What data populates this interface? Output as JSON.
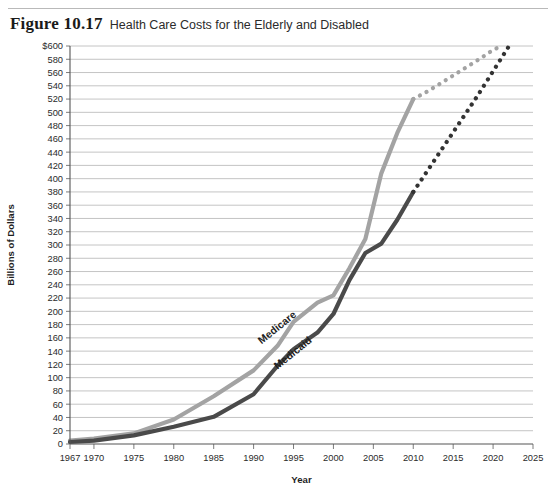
{
  "figure": {
    "number": "Figure 10.17",
    "title": "Health Care Costs for the Elderly and Disabled"
  },
  "chart_data": {
    "type": "line",
    "title": "Health Care Costs for the Elderly and Disabled",
    "xlabel": "Year",
    "ylabel": "Billions of Dollars",
    "xlim": [
      1967,
      2025
    ],
    "ylim": [
      0,
      600
    ],
    "grid": true,
    "legend": "inline-labels",
    "y_ticks": [
      0,
      20,
      40,
      60,
      80,
      100,
      120,
      140,
      160,
      180,
      200,
      220,
      240,
      260,
      280,
      300,
      320,
      340,
      360,
      380,
      400,
      420,
      440,
      460,
      480,
      500,
      520,
      540,
      560,
      580,
      600
    ],
    "y_tick_labels": [
      "0",
      "20",
      "40",
      "60",
      "80",
      "100",
      "120",
      "140",
      "160",
      "180",
      "200",
      "220",
      "240",
      "260",
      "280",
      "300",
      "320",
      "340",
      "360",
      "380",
      "400",
      "420",
      "440",
      "460",
      "480",
      "500",
      "520",
      "540",
      "560",
      "580",
      "$600"
    ],
    "x_ticks": [
      1967,
      1970,
      1975,
      1980,
      1985,
      1990,
      1995,
      2000,
      2005,
      2010,
      2015,
      2020,
      2025
    ],
    "x_tick_labels": [
      "1967",
      "1970",
      "1975",
      "1980",
      "1985",
      "1990",
      "1995",
      "2000",
      "2005",
      "2010",
      "2015",
      "2020",
      "2025"
    ],
    "series": [
      {
        "name": "Medicare",
        "color": "#a3a3a3",
        "projection_color": "#a3a3a3",
        "label_x": 1991,
        "label_y": 150,
        "label_rotation": -39,
        "actual": {
          "x": [
            1967,
            1970,
            1975,
            1980,
            1985,
            1990,
            1993,
            1995,
            1998,
            2000,
            2002,
            2004,
            2006,
            2008,
            2010
          ],
          "y": [
            5,
            8,
            16,
            37,
            72,
            111,
            148,
            184,
            213,
            224,
            265,
            309,
            408,
            469,
            520
          ]
        },
        "projected": {
          "x": [
            2010,
            2012,
            2014,
            2016,
            2018,
            2020,
            2021
          ],
          "y": [
            520,
            533,
            548,
            563,
            578,
            594,
            600
          ]
        }
      },
      {
        "name": "Medicaid",
        "color": "#4a4a4a",
        "projection_color": "#333333",
        "label_x": 1993,
        "label_y": 112,
        "label_rotation": -39,
        "actual": {
          "x": [
            1967,
            1970,
            1975,
            1980,
            1985,
            1990,
            1993,
            1995,
            1998,
            2000,
            2002,
            2004,
            2006,
            2008,
            2010
          ],
          "y": [
            3,
            5,
            13,
            26,
            41,
            75,
            118,
            143,
            168,
            196,
            247,
            288,
            302,
            338,
            380
          ]
        },
        "projected": {
          "x": [
            2010,
            2012,
            2014,
            2016,
            2018,
            2020,
            2022
          ],
          "y": [
            380,
            416,
            452,
            488,
            524,
            562,
            600
          ]
        }
      }
    ]
  }
}
